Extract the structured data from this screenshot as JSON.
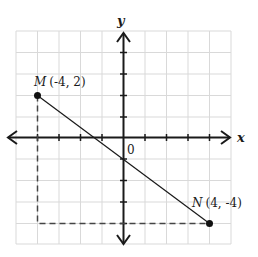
{
  "diagram": {
    "type": "coordinate-plane",
    "grid": {
      "x_min": -5,
      "x_max": 5,
      "y_min": -5,
      "y_max": 5,
      "color": "#d9d9d9"
    },
    "axes": {
      "x_label": "x",
      "y_label": "y",
      "origin_label": "0",
      "color": "#1a1a1a"
    },
    "points": [
      {
        "name": "M",
        "coords": "(-4, 2)",
        "x": -4,
        "y": 2
      },
      {
        "name": "N",
        "coords": "(4, -4)",
        "x": 4,
        "y": -4
      }
    ],
    "segment": {
      "from": "M",
      "to": "N"
    },
    "dashed_guides": [
      {
        "description": "vertical from M down to y=-4",
        "from": [
          -4,
          2
        ],
        "to": [
          -4,
          -4
        ]
      },
      {
        "description": "horizontal from x=-4 to N",
        "from": [
          -4,
          -4
        ],
        "to": [
          4,
          -4
        ]
      }
    ]
  }
}
